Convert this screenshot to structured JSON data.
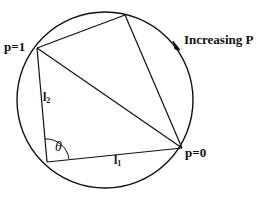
{
  "diagram": {
    "labels": {
      "p_one": "p=1",
      "p_zero": "p=0",
      "increasing": "Increasing P",
      "l2_base": "l",
      "l2_sub": "2",
      "l1_base": "l",
      "l1_sub": "1",
      "theta": "θ"
    },
    "circle": {
      "cx": 105,
      "cy": 100,
      "r": 88
    },
    "vertices": {
      "p1": [
        37,
        48
      ],
      "top": [
        125,
        15
      ],
      "p0": [
        182,
        148
      ],
      "bottom_left": [
        47,
        162
      ]
    },
    "stroke_color": "#111111",
    "background": "#ffffff"
  }
}
